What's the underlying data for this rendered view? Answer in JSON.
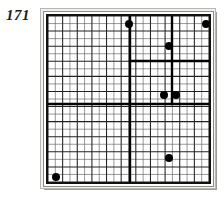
{
  "figure": {
    "number_label": "171",
    "caption": "171"
  },
  "colors": {
    "background": "#ffffff",
    "frame_outer": "#b9b7b2",
    "frame_shadow": "#9e9c98",
    "board_border": "#111111",
    "grid_fine": "#555555",
    "grid_medium": "#222222",
    "grid_thick": "#000000",
    "dot_fill": "#000000",
    "label_text": "#1a1a1a"
  },
  "board": {
    "name": "puzzle-grid-board",
    "width_px": 161,
    "height_px": 166,
    "columns": 22,
    "rows": 22,
    "cell_size_px": 7.3,
    "fine_line_width": 0.6,
    "medium_line_width": 1.0,
    "thick_line_width": 2.2,
    "medium_line_interval": 2
  },
  "regions": {
    "description": "Heavy black partition lines dividing the grid into rectangular blocks",
    "vertical_dividers": [
      {
        "name": "divider-vertical-center",
        "x": 82,
        "y_start": 0,
        "y_end": 166,
        "width": 2.4
      },
      {
        "name": "divider-vertical-right",
        "x": 124,
        "y_start": 0,
        "y_end": 88,
        "width": 2.4
      }
    ],
    "horizontal_dividers": [
      {
        "name": "divider-horizontal-center",
        "y": 88,
        "x_start": 0,
        "x_end": 161,
        "width": 2.4
      },
      {
        "name": "divider-horizontal-upper-right",
        "y": 45,
        "x_start": 82,
        "x_end": 161,
        "width": 2.4
      }
    ]
  },
  "dots": [
    {
      "name": "dot-top-left-block",
      "x": 81,
      "y": 8,
      "r": 4.4
    },
    {
      "name": "dot-top-right-corner",
      "x": 158,
      "y": 8,
      "r": 4.4
    },
    {
      "name": "dot-upper-right",
      "x": 121,
      "y": 30,
      "r": 4.4
    },
    {
      "name": "dot-mid-pair-left",
      "x": 116,
      "y": 79,
      "r": 4.4
    },
    {
      "name": "dot-mid-pair-right",
      "x": 128,
      "y": 79,
      "r": 4.4
    },
    {
      "name": "dot-lower-right",
      "x": 121,
      "y": 142,
      "r": 4.4
    },
    {
      "name": "dot-bottom-left-corner",
      "x": 8,
      "y": 161,
      "r": 4.4
    }
  ],
  "chart_data": {
    "type": "heatmap",
    "title": "171",
    "xlabel": "",
    "ylabel": "",
    "grid": true,
    "legend": "none",
    "categories": [],
    "values": []
  }
}
